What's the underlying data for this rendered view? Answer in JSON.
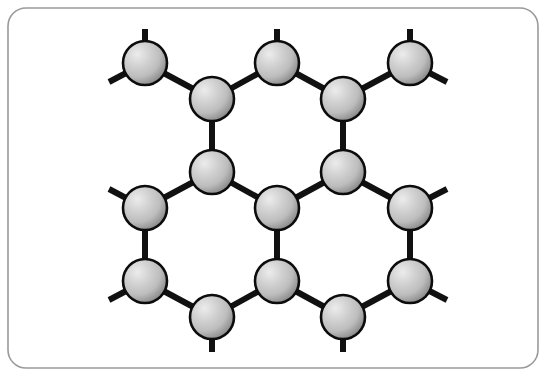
{
  "figure": {
    "canvas": {
      "width": 546,
      "height": 376
    },
    "background_color": "#ffffff"
  },
  "frame": {
    "name": "rounded-border-frame",
    "x": 8,
    "y": 8,
    "width": 530,
    "height": 360,
    "corner_radius": 18,
    "stroke_color": "#9a9a9a",
    "stroke_width": 1.6,
    "fill": "none"
  },
  "style": {
    "bond_color": "#111111",
    "bond_width": 6,
    "bond_cap": "butt",
    "atom_radius": 22,
    "atom_outline_color": "#0c0c0c",
    "atom_outline_width": 2.6,
    "atom_fill_light": "#e8e8e8",
    "atom_fill_mid": "#c3c3c3",
    "atom_fill_dark": "#8c8c8c",
    "highlight_offset_x": "33%",
    "highlight_offset_y": "30%"
  },
  "atoms": [
    {
      "id": "a1",
      "label": "atom-top-left",
      "cx": 145,
      "cy": 63
    },
    {
      "id": "a2",
      "label": "atom-top-center",
      "cx": 277,
      "cy": 63
    },
    {
      "id": "a3",
      "label": "atom-top-right",
      "cx": 410,
      "cy": 63
    },
    {
      "id": "a4",
      "label": "atom-upper-left-inner",
      "cx": 212,
      "cy": 99
    },
    {
      "id": "a5",
      "label": "atom-upper-right-inner",
      "cx": 343,
      "cy": 99
    },
    {
      "id": "a6",
      "label": "atom-mid-upper-left",
      "cx": 212,
      "cy": 172
    },
    {
      "id": "a7",
      "label": "atom-mid-upper-right",
      "cx": 343,
      "cy": 172
    },
    {
      "id": "a8",
      "label": "atom-mid-left",
      "cx": 145,
      "cy": 208
    },
    {
      "id": "a9",
      "label": "atom-mid-center",
      "cx": 277,
      "cy": 208
    },
    {
      "id": "a10",
      "label": "atom-mid-right",
      "cx": 410,
      "cy": 208
    },
    {
      "id": "a11",
      "label": "atom-lower-left",
      "cx": 145,
      "cy": 281
    },
    {
      "id": "a12",
      "label": "atom-lower-center",
      "cx": 277,
      "cy": 281
    },
    {
      "id": "a13",
      "label": "atom-lower-right",
      "cx": 410,
      "cy": 281
    },
    {
      "id": "a14",
      "label": "atom-bottom-left",
      "cx": 212,
      "cy": 317
    },
    {
      "id": "a15",
      "label": "atom-bottom-right",
      "cx": 343,
      "cy": 317
    }
  ],
  "bonds": [
    {
      "id": "b1",
      "label": "bond-a1-a4",
      "x1": 145,
      "y1": 63,
      "x2": 212,
      "y2": 99
    },
    {
      "id": "b2",
      "label": "bond-a4-a2",
      "x1": 212,
      "y1": 99,
      "x2": 277,
      "y2": 63
    },
    {
      "id": "b3",
      "label": "bond-a2-a5",
      "x1": 277,
      "y1": 63,
      "x2": 343,
      "y2": 99
    },
    {
      "id": "b4",
      "label": "bond-a5-a3",
      "x1": 343,
      "y1": 99,
      "x2": 410,
      "y2": 63
    },
    {
      "id": "b5",
      "label": "bond-a4-a6",
      "x1": 212,
      "y1": 99,
      "x2": 212,
      "y2": 172
    },
    {
      "id": "b6",
      "label": "bond-a5-a7",
      "x1": 343,
      "y1": 99,
      "x2": 343,
      "y2": 172
    },
    {
      "id": "b7",
      "label": "bond-a6-a8",
      "x1": 212,
      "y1": 172,
      "x2": 145,
      "y2": 208
    },
    {
      "id": "b8",
      "label": "bond-a6-a9",
      "x1": 212,
      "y1": 172,
      "x2": 277,
      "y2": 208
    },
    {
      "id": "b9",
      "label": "bond-a9-a7",
      "x1": 277,
      "y1": 208,
      "x2": 343,
      "y2": 172
    },
    {
      "id": "b10",
      "label": "bond-a7-a10",
      "x1": 343,
      "y1": 172,
      "x2": 410,
      "y2": 208
    },
    {
      "id": "b11",
      "label": "bond-a8-a11",
      "x1": 145,
      "y1": 208,
      "x2": 145,
      "y2": 281
    },
    {
      "id": "b12",
      "label": "bond-a9-a12",
      "x1": 277,
      "y1": 208,
      "x2": 277,
      "y2": 281
    },
    {
      "id": "b13",
      "label": "bond-a10-a13",
      "x1": 410,
      "y1": 208,
      "x2": 410,
      "y2": 281
    },
    {
      "id": "b14",
      "label": "bond-a11-a14",
      "x1": 145,
      "y1": 281,
      "x2": 212,
      "y2": 317
    },
    {
      "id": "b15",
      "label": "bond-a14-a12",
      "x1": 212,
      "y1": 317,
      "x2": 277,
      "y2": 281
    },
    {
      "id": "b16",
      "label": "bond-a12-a15",
      "x1": 277,
      "y1": 281,
      "x2": 343,
      "y2": 317
    },
    {
      "id": "b17",
      "label": "bond-a15-a13",
      "x1": 343,
      "y1": 317,
      "x2": 410,
      "y2": 281
    }
  ],
  "terminal_stubs": [
    {
      "id": "s1",
      "label": "stub-a1-up",
      "x1": 145,
      "y1": 63,
      "x2": 145,
      "y2": 29
    },
    {
      "id": "s2",
      "label": "stub-a1-down-left",
      "x1": 145,
      "y1": 63,
      "x2": 109,
      "y2": 82
    },
    {
      "id": "s3",
      "label": "stub-a2-up",
      "x1": 277,
      "y1": 63,
      "x2": 277,
      "y2": 29
    },
    {
      "id": "s4",
      "label": "stub-a3-up",
      "x1": 410,
      "y1": 63,
      "x2": 410,
      "y2": 29
    },
    {
      "id": "s5",
      "label": "stub-a3-down-right",
      "x1": 410,
      "y1": 63,
      "x2": 447,
      "y2": 82
    },
    {
      "id": "s6",
      "label": "stub-a8-up-left",
      "x1": 145,
      "y1": 208,
      "x2": 109,
      "y2": 189
    },
    {
      "id": "s7",
      "label": "stub-a10-up-right",
      "x1": 410,
      "y1": 208,
      "x2": 447,
      "y2": 189
    },
    {
      "id": "s8",
      "label": "stub-a11-down-left",
      "x1": 145,
      "y1": 281,
      "x2": 109,
      "y2": 300
    },
    {
      "id": "s9",
      "label": "stub-a13-down-right",
      "x1": 410,
      "y1": 281,
      "x2": 447,
      "y2": 300
    },
    {
      "id": "s10",
      "label": "stub-a14-down",
      "x1": 212,
      "y1": 317,
      "x2": 212,
      "y2": 352
    },
    {
      "id": "s11",
      "label": "stub-a15-down",
      "x1": 343,
      "y1": 317,
      "x2": 343,
      "y2": 352
    }
  ]
}
